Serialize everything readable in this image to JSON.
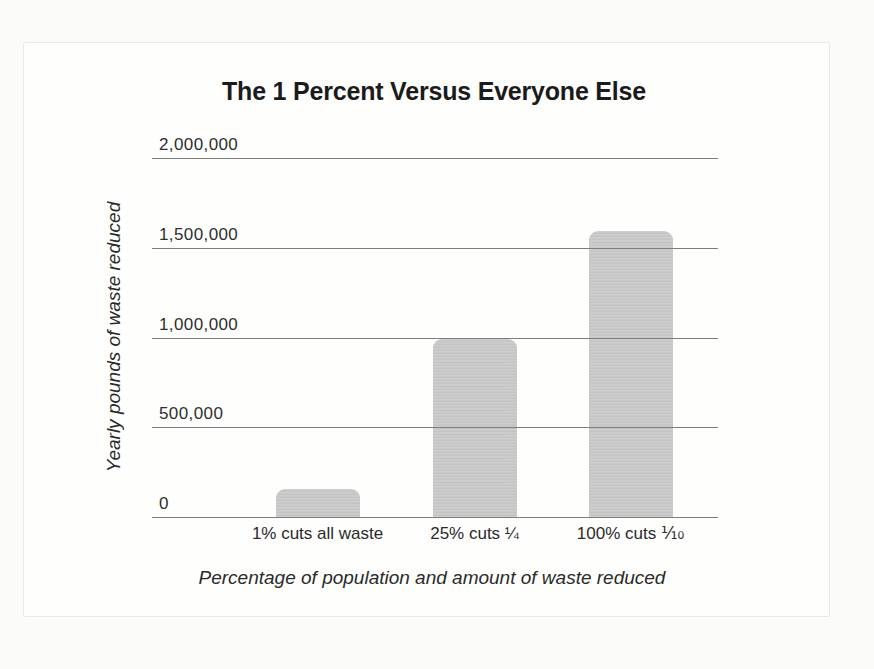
{
  "figure": {
    "background": "#fefefd",
    "border_color": "#eaeae6"
  },
  "chart_data": {
    "type": "bar",
    "title": "The 1 Percent Versus Everyone Else",
    "categories": [
      "1% cuts all waste",
      "25% cuts ¼",
      "100% cuts ⅒"
    ],
    "values": [
      160000,
      1000000,
      1600000
    ],
    "xlabel": "Percentage of population and amount of waste reduced",
    "ylabel": "Yearly pounds of waste reduced",
    "ylim": [
      0,
      2000000
    ],
    "yticks": [
      {
        "value": 0,
        "label": "0"
      },
      {
        "value": 500000,
        "label": "500,000"
      },
      {
        "value": 1000000,
        "label": "1,000,000"
      },
      {
        "value": 1500000,
        "label": "1,500,000"
      },
      {
        "value": 2000000,
        "label": "2,000,000"
      }
    ],
    "grid": "horizontal",
    "legend": "none",
    "bar_color": "#cbcbcb",
    "gridline_color": "#7d7d7d",
    "text_color": "#262626"
  }
}
